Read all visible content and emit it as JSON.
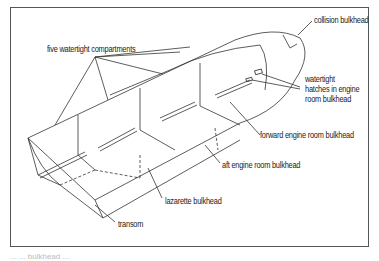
{
  "figure": {
    "labels": {
      "five_compartments": "five watertight compartments",
      "collision": "collision bulkhead",
      "hatches_line1": "watertight",
      "hatches_line2": "hatches in engine",
      "hatches_line3": "room bulkhead",
      "forward_engine": "forward engine room bulkhead",
      "aft_engine": "aft engine room bulkhead",
      "lazarette": "lazarette bulkhead",
      "transom": "transom"
    },
    "caption": "... ... bulkhead ..."
  },
  "colors": {
    "line": "#333333",
    "frame": "#555555",
    "text": "#222222"
  }
}
